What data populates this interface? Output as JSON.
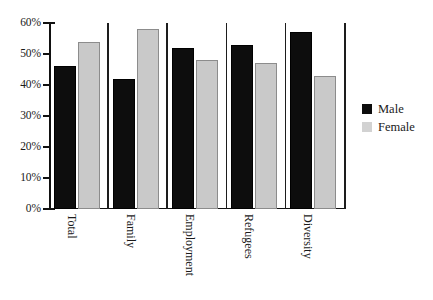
{
  "chart_data": {
    "type": "bar",
    "title": "",
    "subtitle": "",
    "xlabel": "",
    "ylabel": "",
    "categories": [
      "Total",
      "Family",
      "Employment",
      "Refugees",
      "Diversity"
    ],
    "series": [
      {
        "name": "Male",
        "color": "#0d0d0d",
        "values": [
          46,
          42,
          52,
          53,
          57
        ]
      },
      {
        "name": "Female",
        "color": "#c9c9c9",
        "values": [
          54,
          58,
          48,
          47,
          43
        ]
      }
    ],
    "ylim": [
      0,
      60
    ],
    "ytick_values": [
      0,
      10,
      20,
      30,
      40,
      50,
      60
    ],
    "ytick_labels": [
      "0%",
      "10%",
      "20%",
      "30%",
      "40%",
      "50%",
      "60%"
    ],
    "grid": false,
    "legend_position": "right",
    "value_suffix": "%",
    "group_separators": true
  },
  "legend": {
    "entries": [
      {
        "label": "Male",
        "swatch": "male-swatch"
      },
      {
        "label": "Female",
        "swatch": "female-swatch"
      }
    ]
  }
}
